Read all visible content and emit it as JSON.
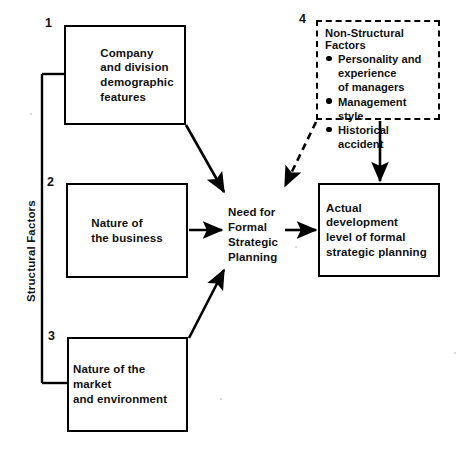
{
  "diagram": {
    "group_label": "Structural Factors",
    "numbers": {
      "one": "1",
      "two": "2",
      "three": "3",
      "four": "4"
    },
    "boxes": {
      "company": {
        "number": "1",
        "text": "Company\nand division\ndemographic\nfeatures"
      },
      "business": {
        "number": "2",
        "text": "Nature of\nthe business"
      },
      "market": {
        "number": "3",
        "text": "Nature of the market\nand environment"
      },
      "non_structural": {
        "number": "4",
        "title": "Non-Structural Factors",
        "items": [
          "Personality and\n  experience\n  of managers",
          "Management style",
          "Historical accident"
        ]
      },
      "need": {
        "text": "Need for\nFormal\nStrategic\nPlanning"
      },
      "actual": {
        "text": "Actual development\nlevel of formal\nstrategic planning"
      }
    },
    "colors": {
      "ink": "#000000",
      "paper": "#ffffff"
    }
  }
}
